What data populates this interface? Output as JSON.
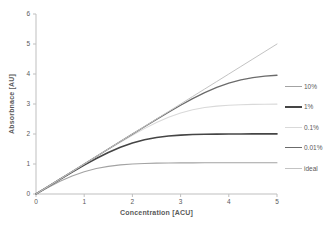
{
  "chart_data": {
    "type": "line",
    "title": "",
    "xlabel": "Concentration [ACU]",
    "ylabel": "Absorbnace [AU]",
    "xlim": [
      0,
      5
    ],
    "ylim": [
      0,
      6
    ],
    "x_ticks": [
      "0",
      "1",
      "2",
      "3",
      "4",
      "5"
    ],
    "y_ticks": [
      "0",
      "1",
      "2",
      "3",
      "4",
      "5",
      "6"
    ],
    "grid": false,
    "legend_position": "right",
    "x": [
      0,
      0.25,
      0.5,
      0.75,
      1,
      1.25,
      1.5,
      1.75,
      2,
      2.25,
      2.5,
      2.75,
      3,
      3.25,
      3.5,
      3.75,
      4,
      4.25,
      4.5,
      4.75,
      5
    ],
    "series": [
      {
        "name": "10%",
        "color": "#a3a3a3",
        "width": 1.1,
        "values": [
          0,
          0.22,
          0.422,
          0.598,
          0.74,
          0.848,
          0.922,
          0.97,
          1.0,
          1.018,
          1.028,
          1.034,
          1.037,
          1.039,
          1.04,
          1.041,
          1.041,
          1.041,
          1.041,
          1.041,
          1.041
        ]
      },
      {
        "name": "1%",
        "color": "#454545",
        "width": 1.6,
        "values": [
          0,
          0.247,
          0.491,
          0.731,
          0.963,
          1.183,
          1.385,
          1.561,
          1.703,
          1.811,
          1.885,
          1.933,
          1.963,
          1.981,
          1.991,
          1.997,
          2.0,
          2.002,
          2.003,
          2.004,
          2.004
        ]
      },
      {
        "name": "0.1%",
        "color": "#d9d9d9",
        "width": 1.1,
        "values": [
          0,
          0.25,
          0.499,
          0.748,
          0.996,
          1.243,
          1.487,
          1.727,
          1.959,
          2.179,
          2.381,
          2.557,
          2.699,
          2.807,
          2.881,
          2.929,
          2.959,
          2.977,
          2.987,
          2.993,
          2.996
        ]
      },
      {
        "name": "0.01%",
        "color": "#6b6b6b",
        "width": 1.3,
        "values": [
          0,
          0.25,
          0.5,
          0.75,
          1.0,
          1.249,
          1.499,
          1.748,
          1.996,
          2.242,
          2.487,
          2.726,
          2.959,
          3.179,
          3.381,
          3.556,
          3.699,
          3.806,
          3.881,
          3.929,
          3.959
        ]
      },
      {
        "name": "ideal",
        "color": "#c3c3c3",
        "width": 1.0,
        "values": [
          0,
          0.25,
          0.5,
          0.75,
          1,
          1.25,
          1.5,
          1.75,
          2,
          2.25,
          2.5,
          2.75,
          3,
          3.25,
          3.5,
          3.75,
          4,
          4.25,
          4.5,
          4.75,
          5
        ]
      }
    ]
  },
  "axis": {
    "line_color": "#bfbfbf",
    "tick_color": "#bfbfbf",
    "text_color": "#595959"
  }
}
